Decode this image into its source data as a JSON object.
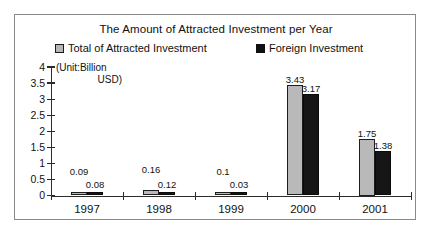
{
  "chart_data": {
    "type": "bar",
    "title": "The Amount of Attracted Investment per Year",
    "unit_note_line1": "(Unit:Billion",
    "unit_note_line2": "USD)",
    "xlabel": "",
    "ylabel": "",
    "ylim": [
      0,
      4
    ],
    "yticks": [
      "0",
      "0.5",
      "1",
      "1.5",
      "2",
      "2.5",
      "3",
      "3.5",
      "4"
    ],
    "grid": false,
    "legend_position": "top",
    "categories": [
      "1997",
      "1998",
      "1999",
      "2000",
      "2001"
    ],
    "series": [
      {
        "name": "Total of Attracted Investment",
        "color": "#b9b9b9",
        "values": [
          0.09,
          0.16,
          0.1,
          3.43,
          1.75
        ],
        "labels": [
          "0.09",
          "0.16",
          "0.1",
          "3.43",
          "1.75"
        ]
      },
      {
        "name": "Foreign Investment",
        "color": "#161616",
        "values": [
          0.08,
          0.12,
          0.03,
          3.17,
          1.38
        ],
        "labels": [
          "0.08",
          "0.12",
          "0.03",
          "3.17",
          "1.38"
        ]
      }
    ]
  }
}
